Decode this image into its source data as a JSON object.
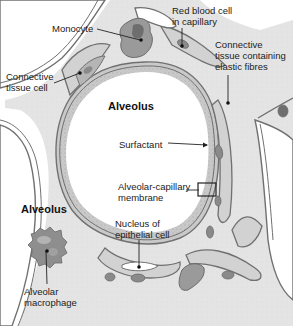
{
  "diagram": {
    "type": "anatomical-illustration",
    "colors": {
      "background": "#ffffff",
      "tissue_fill": "#e3e3e3",
      "membrane_stroke": "#707070",
      "membrane_fill": "#c9c9c9",
      "cell_fill": "#8a8a8a",
      "nucleus_fill": "#5e5e5e",
      "surfactant_dots": "#9a9a9a",
      "leader_line": "#222222"
    },
    "labels": [
      {
        "id": "monocyte",
        "text": "Monocyte",
        "x": 52,
        "y": 23,
        "bold": false
      },
      {
        "id": "rbc",
        "text": "Red blood cell\nin capillary",
        "x": 172,
        "y": 5,
        "bold": false
      },
      {
        "id": "connective-elastic",
        "text": "Connective\ntissue containing\nelastic fibres",
        "x": 215,
        "y": 39,
        "bold": false
      },
      {
        "id": "connective-cell",
        "text": "Connective\ntissue cell",
        "x": 6,
        "y": 71,
        "bold": false
      },
      {
        "id": "alveolus-main",
        "text": "Alveolus",
        "x": 108,
        "y": 100,
        "bold": true
      },
      {
        "id": "surfactant",
        "text": "Surfactant",
        "x": 119,
        "y": 139,
        "bold": false
      },
      {
        "id": "membrane",
        "text": "Alveolar-capillary\nmembrane",
        "x": 118,
        "y": 181,
        "bold": false
      },
      {
        "id": "alveolus-secondary",
        "text": "Alveolus",
        "x": 21,
        "y": 203,
        "bold": true
      },
      {
        "id": "nucleus",
        "text": "Nucleus of\nepithelial cell",
        "x": 115,
        "y": 218,
        "bold": false
      },
      {
        "id": "macrophage",
        "text": "Alveolar\nmacrophage",
        "x": 24,
        "y": 286,
        "bold": false
      }
    ]
  }
}
